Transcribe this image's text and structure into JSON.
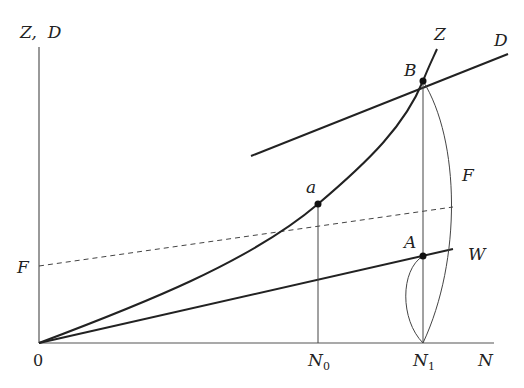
{
  "diagram": {
    "type": "economic-curve-diagram",
    "axes": {
      "y_label": "Z,  D",
      "x_label": "N",
      "origin_label": "0"
    },
    "x_ticks": [
      {
        "label": "N",
        "subscript": "0"
      },
      {
        "label": "N",
        "subscript": "1"
      }
    ],
    "curves": [
      {
        "name": "Z",
        "label": "Z",
        "style": "solid-thick",
        "shape": "convex curve from origin"
      },
      {
        "name": "D",
        "label": "D",
        "style": "solid-thick",
        "shape": "straight line"
      },
      {
        "name": "W",
        "label": "W",
        "style": "solid-thick",
        "shape": "straight line from origin"
      },
      {
        "name": "F",
        "label_left": "F",
        "label_right": "F",
        "style": "dashed",
        "shape": "straight line"
      }
    ],
    "points": [
      {
        "name": "B",
        "label": "B"
      },
      {
        "name": "a",
        "label": "a"
      },
      {
        "name": "A",
        "label": "A"
      }
    ],
    "colors": {
      "line": "#222222",
      "thin": "#444444",
      "background": "#ffffff"
    }
  }
}
